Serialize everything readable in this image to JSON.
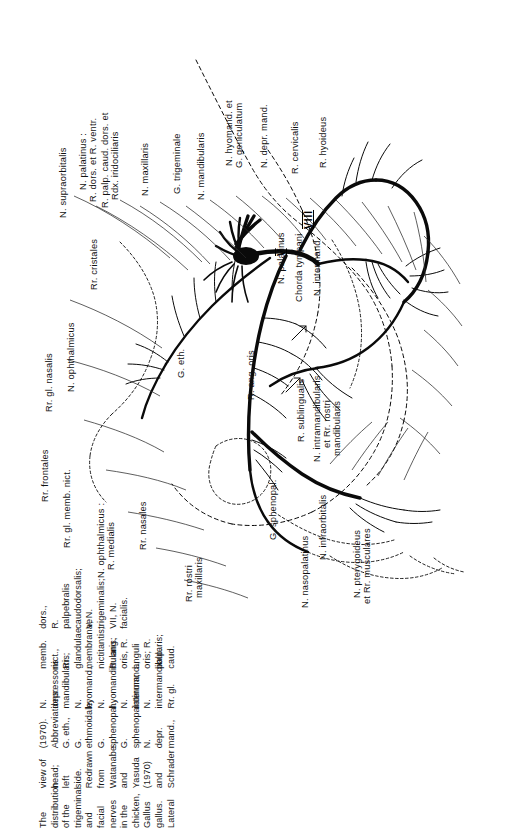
{
  "figure": {
    "caption_label": "Fig. 1",
    "caption_text": "The distribution of the trigeminal and facial nerves in the chicken, Gallus gallus. Lateral view of head; left side. Redrawn from Watanabe and Yasuda (1970) and Schrader (1970). Abbreviations: G. eth., G. ethmoidale; G. sphenopal., G. sphenopalatinum; N. depr. mand., N. depressoris mandibularis; N. hyomand., N. hyomandibularis; N. intermand., N. intermandibularis; Rr. gl. memb. nict., Rr. glandulae membranae nictitantis; R. ang. oris, R. anguli oris; R. palp. caud. dors., R. palpebralis caudodorsalis; V, N. trigeminalis; VII, N. facialis.",
    "caption_lines": [
      "Fig. 1   The distribution of",
      "the trigeminal and facial",
      "nerves in the chicken, Gallus",
      "gallus. Lateral view of head;",
      "left side. Redrawn from",
      "Watanabe and Yasuda",
      "(1970) and Schrader (1970).",
      "Abbreviations: G. eth., G.",
      "ethmoidale; G. sphenopal.,",
      "G. sphenopalatinum; N. depr.",
      "mand., N. depressoris",
      "mandibularis; N. hyomand.,",
      "N. hyomandibularis; N.",
      "intermand., N. intermandibu-",
      "laris; Rr. gl. memb. nict., Rr.",
      "glandulae membranae",
      "nictitantis; R. ang. oris, R.",
      "anguli oris; R. palp. caud.",
      "dors., R. palpebralis",
      "caudodorsalis; V, N.",
      "trigeminalis; VII, N. facialis."
    ],
    "roman_markers": [
      {
        "id": "marker-v",
        "text": "V"
      },
      {
        "id": "marker-viii",
        "text": "VIII"
      }
    ],
    "labels": [
      {
        "id": "rr-gl-nasalis",
        "text": "Rr. gl. nasalis"
      },
      {
        "id": "n-ophthalmicus",
        "text": "N. ophthalmicus"
      },
      {
        "id": "rr-cristales",
        "text": "Rr. cristales"
      },
      {
        "id": "n-supraorbitalis",
        "text": "N. supraorbitalis"
      },
      {
        "id": "n-palatinus",
        "text": "N. palatinus :"
      },
      {
        "id": "r-dors-et-r-ventr",
        "text": "R. dors. et R. ventr."
      },
      {
        "id": "r-palp-caud-dors-et",
        "text": "R. palp. caud. dors. et"
      },
      {
        "id": "rdx-iridociliaris",
        "text": "Rdx. iridociliaris"
      },
      {
        "id": "n-maxillaris",
        "text": "N. maxillaris"
      },
      {
        "id": "g-trigeminale",
        "text": "G. trigeminale"
      },
      {
        "id": "n-mandibularis",
        "text": "N. mandibularis"
      },
      {
        "id": "n-hyomand-et",
        "text": "N. hyomand. et"
      },
      {
        "id": "g-geniculatum",
        "text": "G. geniculatum"
      },
      {
        "id": "n-depr-mand",
        "text": "N. depr. mand."
      },
      {
        "id": "r-cervicalis",
        "text": "R. cervicalis"
      },
      {
        "id": "r-hyoideus",
        "text": "R. hyoideus"
      },
      {
        "id": "n-palatinus-right",
        "text": "N. palatinus"
      },
      {
        "id": "chorda-tympani",
        "text": "Chorda tympani"
      },
      {
        "id": "n-intermand",
        "text": "N. intermand."
      },
      {
        "id": "r-sublingualis",
        "text": "R. sublingualis"
      },
      {
        "id": "n-intramandibularis",
        "text": "N. intramandibularis"
      },
      {
        "id": "et-rr-rostri",
        "text": "et Rr. rostri"
      },
      {
        "id": "mandibularis-sub",
        "text": "mandibularis"
      },
      {
        "id": "rr-frontales",
        "text": "Rr. frontales"
      },
      {
        "id": "rr-gl-memb-nict",
        "text": "Rr. gl. memb. nict."
      },
      {
        "id": "n-ophthalmicus-2",
        "text": "N. ophthalmicus :"
      },
      {
        "id": "r-medialis",
        "text": "R. medialis"
      },
      {
        "id": "rr-nasales",
        "text": "Rr. nasales"
      },
      {
        "id": "rr-rostri",
        "text": "Rr. rostri"
      },
      {
        "id": "maxillaris-sub",
        "text": "maxillaris"
      },
      {
        "id": "g-eth",
        "text": "G. eth."
      },
      {
        "id": "r-ang-oris",
        "text": "R. ang. oris"
      },
      {
        "id": "g-sphenopal",
        "text": "G. sphenopal."
      },
      {
        "id": "n-nasopalatinus",
        "text": "N. nasopalatinus"
      },
      {
        "id": "n-infraorbitalis",
        "text": "N. infraorbitalis"
      },
      {
        "id": "n-pterygoideus",
        "text": "N. pterygoideus"
      },
      {
        "id": "et-rr-musculares",
        "text": "et Rr. musculares"
      }
    ]
  }
}
